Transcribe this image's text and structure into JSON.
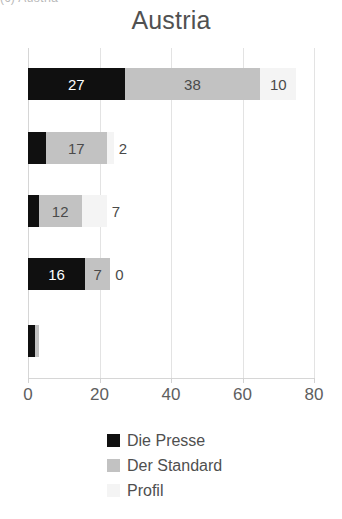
{
  "caption_fragment": "(c) Austria",
  "chart_data": {
    "type": "bar",
    "orientation": "horizontal",
    "stacked": true,
    "title": "Austria",
    "xlabel": "",
    "ylabel": "",
    "xlim": [
      0,
      80
    ],
    "xticks": [
      0,
      20,
      40,
      60,
      80
    ],
    "xtick_labels": [
      "0",
      "20",
      "40",
      "60",
      "80"
    ],
    "grid": true,
    "grid_axis": "x",
    "legend_position": "bottom",
    "categories": [
      "",
      "",
      "",
      "",
      ""
    ],
    "series": [
      {
        "name": "Die Presse",
        "color": "#101010",
        "values": [
          27,
          5,
          3,
          16,
          2
        ]
      },
      {
        "name": "Der Standard",
        "color": "#c2c2c2",
        "values": [
          38,
          17,
          12,
          7,
          1
        ]
      },
      {
        "name": "Profil",
        "color": "#f4f4f4",
        "values": [
          10,
          2,
          7,
          0,
          0
        ]
      }
    ],
    "bar_labels": [
      [
        "27",
        "38",
        "10"
      ],
      [
        "5",
        "17",
        "2"
      ],
      [
        "3",
        "12",
        "7"
      ],
      [
        "16",
        "7",
        "0"
      ],
      [
        "",
        "",
        ""
      ]
    ],
    "totals": [
      75,
      24,
      22,
      23,
      3
    ]
  },
  "legend": {
    "items": [
      {
        "label": "Die Presse",
        "color": "#101010"
      },
      {
        "label": "Der Standard",
        "color": "#c2c2c2"
      },
      {
        "label": "Profil",
        "color": "#f4f4f4"
      }
    ]
  }
}
